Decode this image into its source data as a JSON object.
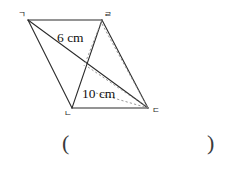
{
  "figure": {
    "type": "parallelogram-with-diagonals",
    "vertices": [
      {
        "name": "vertex-top-left",
        "label": "ㄱ",
        "x": 28,
        "y": 20,
        "label_x": 18,
        "label_y": 17
      },
      {
        "name": "vertex-top-right",
        "label": "ㄹ",
        "x": 102,
        "y": 20,
        "label_x": 104,
        "label_y": 17
      },
      {
        "name": "vertex-bottom-right",
        "label": "ㄷ",
        "x": 148,
        "y": 108,
        "label_x": 152,
        "label_y": 113
      },
      {
        "name": "vertex-bottom-left",
        "label": "ㄴ",
        "x": 72,
        "y": 108,
        "label_x": 64,
        "label_y": 116
      }
    ],
    "intersection": {
      "x": 88,
      "y": 67
    },
    "foot_of_height": {
      "x": 84,
      "y": 65
    },
    "measurements": [
      {
        "name": "upper-length-label",
        "text": "6 cm",
        "x": 57,
        "y": 42
      },
      {
        "name": "lower-length-label",
        "text": "10 cm",
        "x": 82,
        "y": 98
      }
    ]
  },
  "answer": {
    "open_paren": "(",
    "close_paren": ")"
  }
}
